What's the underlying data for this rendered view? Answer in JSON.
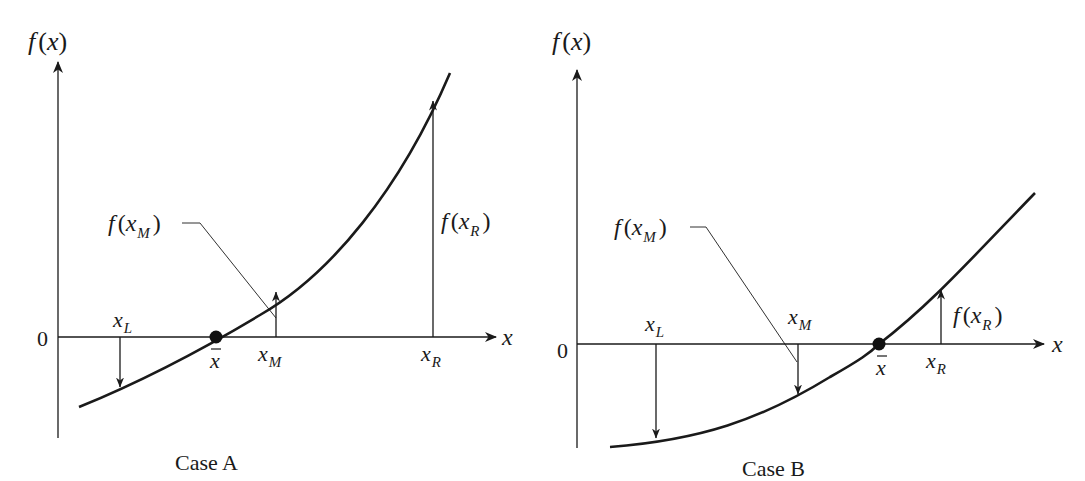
{
  "figure": {
    "colors": {
      "ink": "#1a1a1a",
      "background": "#ffffff"
    }
  },
  "panels": [
    {
      "id": "case-a",
      "caption": "Case A",
      "y_axis_label": {
        "f": "f",
        "open": "(",
        "var": "x",
        "close": ")"
      },
      "x_axis_label": "x",
      "zero_label": "0",
      "root_label": "x",
      "points": {
        "xL": {
          "base": "x",
          "sub": "L",
          "sign": "negative"
        },
        "xM": {
          "base": "x",
          "sub": "M",
          "sign": "positive"
        },
        "xR": {
          "base": "x",
          "sub": "R",
          "sign": "positive"
        }
      },
      "callouts": {
        "fxM": {
          "f": "f",
          "open": "(",
          "base": "x",
          "sub": "M",
          "close": ")"
        },
        "fxR": {
          "f": "f",
          "open": "(",
          "base": "x",
          "sub": "R",
          "close": ")"
        }
      }
    },
    {
      "id": "case-b",
      "caption": "Case B",
      "y_axis_label": {
        "f": "f",
        "open": "(",
        "var": "x",
        "close": ")"
      },
      "x_axis_label": "x",
      "zero_label": "0",
      "root_label": "x",
      "points": {
        "xL": {
          "base": "x",
          "sub": "L",
          "sign": "negative"
        },
        "xM": {
          "base": "x",
          "sub": "M",
          "sign": "negative"
        },
        "xR": {
          "base": "x",
          "sub": "R",
          "sign": "positive"
        }
      },
      "callouts": {
        "fxM": {
          "f": "f",
          "open": "(",
          "base": "x",
          "sub": "M",
          "close": ")"
        },
        "fxR": {
          "f": "f",
          "open": "(",
          "base": "x",
          "sub": "R",
          "close": ")"
        }
      }
    }
  ]
}
